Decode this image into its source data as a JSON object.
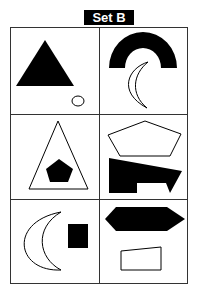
{
  "title": "Set B",
  "colors": {
    "ink": "#000000",
    "paper": "#ffffff",
    "grid": "#333333"
  },
  "grid": {
    "rows": 3,
    "cols": 2
  },
  "cells": [
    {
      "row": 1,
      "col": 1,
      "shapes": [
        "filled-triangle",
        "outline-small-circle"
      ]
    },
    {
      "row": 1,
      "col": 2,
      "shapes": [
        "filled-semicircle-arch",
        "outline-crescent"
      ]
    },
    {
      "row": 2,
      "col": 1,
      "shapes": [
        "outline-triangle",
        "filled-pentagon"
      ]
    },
    {
      "row": 2,
      "col": 2,
      "shapes": [
        "outline-pentagon",
        "filled-irregular-polygon"
      ]
    },
    {
      "row": 3,
      "col": 1,
      "shapes": [
        "outline-crescent",
        "filled-rectangle"
      ]
    },
    {
      "row": 3,
      "col": 2,
      "shapes": [
        "filled-hexagon",
        "outline-trapezoid"
      ]
    }
  ]
}
